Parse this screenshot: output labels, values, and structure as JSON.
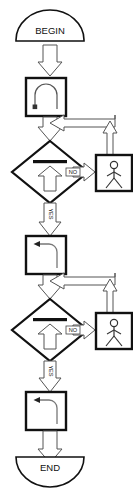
{
  "diagram": {
    "type": "flowchart",
    "orientation": "top-to-bottom",
    "background_color": "#ffffff",
    "stroke_color": "#111111",
    "fill_color": "#ffffff",
    "arrow_fill_color": "#ffffff",
    "arrow_stroke_color": "#555555",
    "width": 133,
    "height": 490
  },
  "nodes": {
    "begin": {
      "label": "BEGIN",
      "shape": "dome-terminator-up",
      "icon": "begin-terminator-icon"
    },
    "end": {
      "label": "END",
      "shape": "dome-terminator-down",
      "icon": "end-terminator-icon"
    },
    "process_1": {
      "label": "",
      "shape": "square-process",
      "icon": "u-turn-arrow-icon"
    },
    "process_2": {
      "label": "",
      "shape": "square-process",
      "icon": "left-turn-arrow-icon"
    },
    "process_3": {
      "label": "",
      "shape": "square-process",
      "icon": "left-turn-arrow-icon"
    },
    "decision_1": {
      "label": "",
      "shape": "diamond-decision",
      "icon": "bar-over-up-arrow-icon"
    },
    "decision_2": {
      "label": "",
      "shape": "diamond-decision",
      "icon": "bar-over-up-arrow-icon"
    },
    "action_1": {
      "label": "",
      "shape": "square-process",
      "icon": "walking-person-icon"
    },
    "action_2": {
      "label": "",
      "shape": "square-process",
      "icon": "walking-person-icon"
    }
  },
  "branch_labels": {
    "no_1": "NO",
    "yes_1": "YES",
    "no_2": "NO",
    "yes_2": "YES"
  },
  "edges": [
    {
      "from": "begin",
      "to": "process_1",
      "label": "",
      "direction": "down"
    },
    {
      "from": "process_1",
      "to": "decision_1",
      "label": "",
      "direction": "down"
    },
    {
      "from": "decision_1",
      "to": "action_1",
      "label": "NO",
      "direction": "right"
    },
    {
      "from": "action_1",
      "to": "loop_join_1",
      "label": "",
      "direction": "up"
    },
    {
      "from": "loop_join_1",
      "to": "process_1_out",
      "label": "",
      "direction": "left"
    },
    {
      "from": "decision_1",
      "to": "process_2",
      "label": "YES",
      "direction": "down"
    },
    {
      "from": "process_2",
      "to": "decision_2",
      "label": "",
      "direction": "down"
    },
    {
      "from": "decision_2",
      "to": "action_2",
      "label": "NO",
      "direction": "right"
    },
    {
      "from": "action_2",
      "to": "loop_join_2",
      "label": "",
      "direction": "up"
    },
    {
      "from": "loop_join_2",
      "to": "process_2_out",
      "label": "",
      "direction": "left"
    },
    {
      "from": "decision_2",
      "to": "process_3",
      "label": "YES",
      "direction": "down"
    },
    {
      "from": "process_3",
      "to": "end",
      "label": "",
      "direction": "down"
    }
  ]
}
